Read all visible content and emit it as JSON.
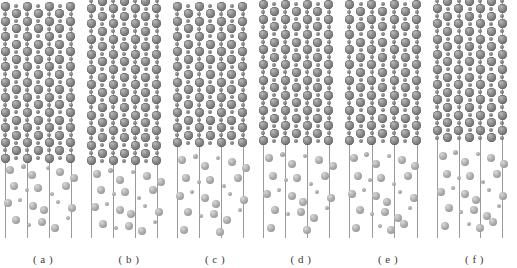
{
  "figure": {
    "type": "multi-panel-atomistic-snapshot",
    "panel_count": 6,
    "width_px": 517,
    "height_px": 268,
    "background_color": "#ffffff"
  },
  "legend_colors": {
    "crystal_large_atom": "#7a7a7a",
    "crystal_small_atom": "#707070",
    "disordered_large_atom": "#b0b0b0",
    "disordered_small_atom": "#a0a0a0",
    "guide_line": "#9a9a9a",
    "caption_text": "#3b3b3b"
  },
  "panels": [
    {
      "id": "a",
      "caption": "( a )",
      "left_px": 0,
      "width_px": 86,
      "line_count": 4,
      "line_x_pct": [
        6,
        31.5,
        57,
        82.5
      ],
      "crystal_rows": 11,
      "crystal_row_spacing_px": 15.2,
      "crystal_top_px": 6,
      "crystal_bottom_px": 158,
      "row_phase": 0,
      "disordered_atom_count": 22,
      "disordered_top_px": 160,
      "disordered_bottom_px": 238
    },
    {
      "id": "b",
      "caption": "( b )",
      "left_px": 86,
      "width_px": 86,
      "line_count": 4,
      "line_x_pct": [
        6,
        31.5,
        57,
        82.5
      ],
      "crystal_rows": 11,
      "crystal_row_spacing_px": 15.2,
      "crystal_top_px": 1,
      "crystal_bottom_px": 163,
      "row_phase": 1,
      "disordered_atom_count": 22,
      "disordered_top_px": 165,
      "disordered_bottom_px": 238
    },
    {
      "id": "c",
      "caption": "( c )",
      "left_px": 172,
      "width_px": 86,
      "line_count": 4,
      "line_x_pct": [
        6,
        31.5,
        57,
        82.5
      ],
      "crystal_rows": 10,
      "crystal_row_spacing_px": 15.2,
      "crystal_top_px": 6,
      "crystal_bottom_px": 150,
      "row_phase": 0,
      "disordered_atom_count": 24,
      "disordered_top_px": 152,
      "disordered_bottom_px": 238
    },
    {
      "id": "d",
      "caption": "( d )",
      "left_px": 258,
      "width_px": 86,
      "line_count": 4,
      "line_x_pct": [
        6,
        31.5,
        57,
        82.5
      ],
      "crystal_rows": 10,
      "crystal_row_spacing_px": 15.2,
      "crystal_top_px": 4,
      "crystal_bottom_px": 148,
      "row_phase": 0,
      "disordered_atom_count": 24,
      "disordered_top_px": 150,
      "disordered_bottom_px": 238
    },
    {
      "id": "e",
      "caption": "( e )",
      "left_px": 344,
      "width_px": 88,
      "line_count": 4,
      "line_x_pct": [
        6,
        31.5,
        57,
        82.5
      ],
      "crystal_rows": 10,
      "crystal_row_spacing_px": 15.2,
      "crystal_top_px": 4,
      "crystal_bottom_px": 148,
      "row_phase": 0,
      "disordered_atom_count": 26,
      "disordered_top_px": 150,
      "disordered_bottom_px": 238
    },
    {
      "id": "f",
      "caption": "( f )",
      "left_px": 432,
      "width_px": 85,
      "line_count": 4,
      "line_x_pct": [
        6,
        31.5,
        57,
        82.5
      ],
      "crystal_rows": 10,
      "crystal_row_spacing_px": 15.2,
      "crystal_top_px": 1,
      "crystal_bottom_px": 145,
      "row_phase": 1,
      "disordered_atom_count": 26,
      "disordered_top_px": 147,
      "disordered_bottom_px": 238
    }
  ],
  "atom_sizes": {
    "crystal_large_px": 9,
    "crystal_small_px": 4,
    "disordered_large_px": 8,
    "disordered_small_px": 4
  },
  "disordered_positions": {
    "a": [
      [
        10,
        170,
        8
      ],
      [
        23,
        166,
        5
      ],
      [
        32,
        175,
        8
      ],
      [
        48,
        168,
        4
      ],
      [
        60,
        172,
        8
      ],
      [
        74,
        178,
        8
      ],
      [
        14,
        186,
        8
      ],
      [
        27,
        190,
        4
      ],
      [
        38,
        188,
        8
      ],
      [
        52,
        194,
        4
      ],
      [
        66,
        186,
        8
      ],
      [
        8,
        203,
        8
      ],
      [
        20,
        200,
        4
      ],
      [
        33,
        206,
        8
      ],
      [
        44,
        210,
        8
      ],
      [
        58,
        202,
        4
      ],
      [
        72,
        208,
        8
      ],
      [
        16,
        220,
        8
      ],
      [
        29,
        225,
        4
      ],
      [
        42,
        222,
        8
      ],
      [
        55,
        228,
        8
      ],
      [
        68,
        218,
        4
      ]
    ],
    "b": [
      [
        11,
        174,
        8
      ],
      [
        24,
        170,
        5
      ],
      [
        34,
        180,
        8
      ],
      [
        47,
        172,
        4
      ],
      [
        61,
        176,
        8
      ],
      [
        75,
        182,
        8
      ],
      [
        15,
        190,
        8
      ],
      [
        28,
        194,
        4
      ],
      [
        39,
        192,
        8
      ],
      [
        53,
        198,
        4
      ],
      [
        67,
        190,
        8
      ],
      [
        9,
        207,
        8
      ],
      [
        21,
        204,
        4
      ],
      [
        34,
        210,
        8
      ],
      [
        45,
        214,
        8
      ],
      [
        59,
        206,
        4
      ],
      [
        73,
        212,
        8
      ],
      [
        17,
        224,
        8
      ],
      [
        30,
        228,
        4
      ],
      [
        43,
        226,
        8
      ],
      [
        56,
        231,
        8
      ],
      [
        69,
        222,
        4
      ]
    ],
    "c": [
      [
        10,
        160,
        8
      ],
      [
        23,
        156,
        5
      ],
      [
        33,
        166,
        8
      ],
      [
        46,
        158,
        4
      ],
      [
        60,
        162,
        8
      ],
      [
        74,
        168,
        8
      ],
      [
        14,
        178,
        8
      ],
      [
        27,
        182,
        4
      ],
      [
        38,
        180,
        8
      ],
      [
        52,
        186,
        4
      ],
      [
        66,
        178,
        8
      ],
      [
        8,
        196,
        8
      ],
      [
        20,
        192,
        4
      ],
      [
        33,
        198,
        8
      ],
      [
        44,
        204,
        8
      ],
      [
        58,
        194,
        4
      ],
      [
        72,
        200,
        8
      ],
      [
        16,
        212,
        8
      ],
      [
        29,
        216,
        4
      ],
      [
        42,
        214,
        8
      ],
      [
        55,
        220,
        8
      ],
      [
        68,
        210,
        4
      ],
      [
        12,
        230,
        8
      ],
      [
        48,
        232,
        8
      ]
    ],
    "d": [
      [
        11,
        158,
        8
      ],
      [
        24,
        154,
        5
      ],
      [
        34,
        164,
        8
      ],
      [
        47,
        156,
        4
      ],
      [
        61,
        160,
        8
      ],
      [
        75,
        166,
        8
      ],
      [
        15,
        176,
        8
      ],
      [
        28,
        180,
        4
      ],
      [
        39,
        178,
        8
      ],
      [
        53,
        184,
        4
      ],
      [
        67,
        176,
        8
      ],
      [
        9,
        194,
        8
      ],
      [
        21,
        190,
        4
      ],
      [
        34,
        196,
        8
      ],
      [
        45,
        202,
        8
      ],
      [
        59,
        192,
        4
      ],
      [
        73,
        198,
        8
      ],
      [
        17,
        210,
        8
      ],
      [
        30,
        214,
        4
      ],
      [
        43,
        212,
        8
      ],
      [
        56,
        218,
        8
      ],
      [
        69,
        208,
        4
      ],
      [
        13,
        228,
        8
      ],
      [
        49,
        230,
        8
      ]
    ],
    "e": [
      [
        10,
        158,
        8
      ],
      [
        22,
        154,
        5
      ],
      [
        32,
        164,
        8
      ],
      [
        45,
        156,
        4
      ],
      [
        58,
        160,
        8
      ],
      [
        71,
        166,
        8
      ],
      [
        14,
        176,
        8
      ],
      [
        26,
        180,
        4
      ],
      [
        37,
        178,
        8
      ],
      [
        50,
        184,
        4
      ],
      [
        64,
        176,
        8
      ],
      [
        8,
        194,
        8
      ],
      [
        20,
        190,
        4
      ],
      [
        32,
        196,
        8
      ],
      [
        43,
        202,
        8
      ],
      [
        56,
        192,
        4
      ],
      [
        70,
        198,
        8
      ],
      [
        16,
        210,
        8
      ],
      [
        28,
        214,
        4
      ],
      [
        41,
        212,
        8
      ],
      [
        54,
        218,
        8
      ],
      [
        66,
        208,
        4
      ],
      [
        12,
        228,
        8
      ],
      [
        36,
        226,
        4
      ],
      [
        47,
        230,
        8
      ],
      [
        60,
        224,
        8
      ]
    ],
    "f": [
      [
        11,
        156,
        8
      ],
      [
        23,
        152,
        5
      ],
      [
        33,
        162,
        8
      ],
      [
        46,
        154,
        4
      ],
      [
        59,
        158,
        8
      ],
      [
        72,
        164,
        8
      ],
      [
        15,
        174,
        8
      ],
      [
        27,
        178,
        4
      ],
      [
        38,
        176,
        8
      ],
      [
        51,
        182,
        4
      ],
      [
        65,
        174,
        8
      ],
      [
        9,
        192,
        8
      ],
      [
        21,
        188,
        4
      ],
      [
        33,
        194,
        8
      ],
      [
        44,
        200,
        8
      ],
      [
        57,
        190,
        4
      ],
      [
        71,
        196,
        8
      ],
      [
        17,
        208,
        8
      ],
      [
        29,
        212,
        4
      ],
      [
        42,
        210,
        8
      ],
      [
        55,
        216,
        8
      ],
      [
        67,
        206,
        4
      ],
      [
        13,
        226,
        8
      ],
      [
        37,
        224,
        4
      ],
      [
        48,
        228,
        8
      ],
      [
        61,
        222,
        8
      ]
    ]
  }
}
